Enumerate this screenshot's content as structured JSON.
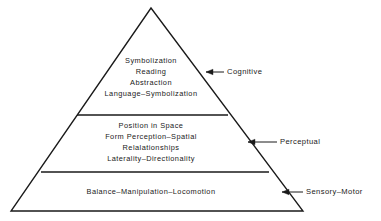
{
  "figure": {
    "type": "pyramid-hierarchy-diagram",
    "background_color": "#ffffff",
    "stroke_color": "#1a1a1a",
    "text_color": "#1a1a1a"
  },
  "pyramid": {
    "apex": {
      "x": 151,
      "y": 8
    },
    "base_left": {
      "x": 11,
      "y": 211
    },
    "base_right": {
      "x": 303,
      "y": 211
    },
    "dividers": [
      {
        "name": "cognitive-perceptual-divider",
        "y": 115,
        "x1": 77,
        "x2": 228
      },
      {
        "name": "perceptual-sensory-divider",
        "y": 172,
        "x1": 41,
        "x2": 269
      }
    ]
  },
  "tiers": [
    {
      "id": "cognitive",
      "label": "Cognitive",
      "lines": [
        "Symbolization",
        "Reading",
        "Abstraction",
        "Language–Symbolization"
      ]
    },
    {
      "id": "perceptual",
      "label": "Perceptual",
      "lines": [
        "Position in Space",
        "Form Perception–Spatial",
        "Relalationships",
        "Laterality–Directionality"
      ]
    },
    {
      "id": "sensory-motor",
      "label": "Sensory–Motor",
      "lines": [
        "Balance–Manipulation–Locomotion"
      ]
    }
  ],
  "callouts": [
    {
      "id": "cognitive",
      "label": "Cognitive",
      "arrow_tip": {
        "x": 206,
        "y": 72
      },
      "line_end": {
        "x": 224,
        "y": 72
      }
    },
    {
      "id": "perceptual",
      "label": "Perceptual",
      "arrow_tip": {
        "x": 248,
        "y": 142
      },
      "line_end": {
        "x": 277,
        "y": 142
      }
    },
    {
      "id": "sensory-motor",
      "label": "Sensory–Motor",
      "arrow_tip": {
        "x": 282,
        "y": 192
      },
      "line_end": {
        "x": 303,
        "y": 192
      }
    }
  ]
}
